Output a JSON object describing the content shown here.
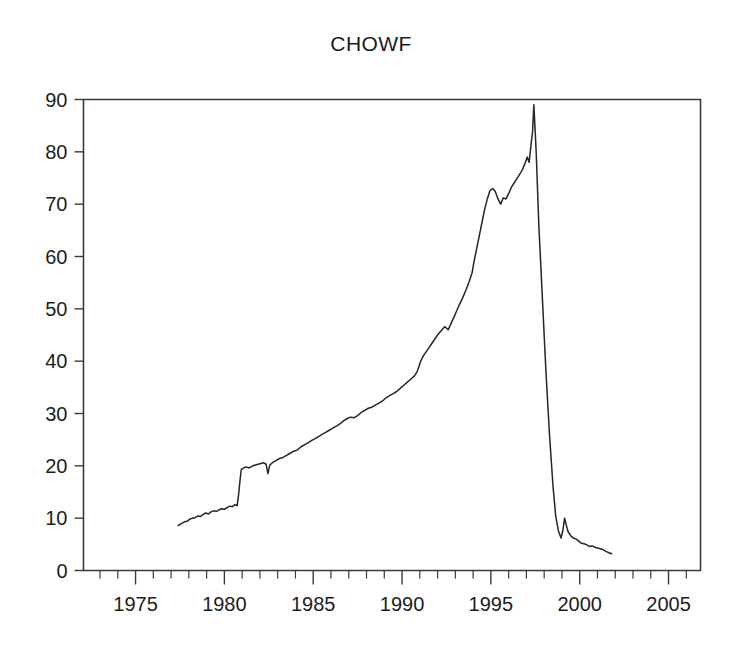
{
  "chart_data": {
    "type": "line",
    "title": "CHOWF",
    "xlabel": "",
    "ylabel": "",
    "xlim": [
      1972.07,
      2006.8
    ],
    "ylim": [
      0,
      90
    ],
    "grid": false,
    "legend": null,
    "x_ticks": [
      1975,
      1980,
      1985,
      1990,
      1995,
      2000,
      2005
    ],
    "x_tick_labels": [
      "1975",
      "1980",
      "1985",
      "1990",
      "1995",
      "2000",
      "2005"
    ],
    "x_minor_tick_step": 1,
    "y_ticks": [
      0,
      10,
      20,
      30,
      40,
      50,
      60,
      70,
      80,
      90
    ],
    "y_tick_labels": [
      "0",
      "10",
      "20",
      "30",
      "40",
      "50",
      "60",
      "70",
      "80",
      "90"
    ],
    "line_color": "#262626",
    "series": [
      {
        "name": "CHOWF",
        "x": [
          1977.4,
          1977.6,
          1977.75,
          1977.9,
          1978.05,
          1978.2,
          1978.35,
          1978.5,
          1978.65,
          1978.8,
          1978.95,
          1979.1,
          1979.25,
          1979.4,
          1979.55,
          1979.7,
          1979.85,
          1980.0,
          1980.15,
          1980.3,
          1980.45,
          1980.6,
          1980.72,
          1980.8,
          1980.88,
          1980.95,
          1981.05,
          1981.2,
          1981.4,
          1981.6,
          1981.8,
          1982.0,
          1982.2,
          1982.35,
          1982.45,
          1982.55,
          1982.7,
          1982.9,
          1983.1,
          1983.3,
          1983.5,
          1983.7,
          1983.9,
          1984.1,
          1984.3,
          1984.5,
          1984.7,
          1984.9,
          1985.1,
          1985.3,
          1985.5,
          1985.7,
          1985.9,
          1986.1,
          1986.3,
          1986.5,
          1986.7,
          1986.9,
          1987.1,
          1987.3,
          1987.5,
          1987.7,
          1987.9,
          1988.1,
          1988.3,
          1988.5,
          1988.7,
          1988.9,
          1989.1,
          1989.3,
          1989.5,
          1989.7,
          1989.9,
          1990.1,
          1990.3,
          1990.5,
          1990.7,
          1990.85,
          1990.95,
          1991.05,
          1991.2,
          1991.4,
          1991.6,
          1991.8,
          1992.0,
          1992.2,
          1992.4,
          1992.6,
          1992.8,
          1993.0,
          1993.2,
          1993.4,
          1993.6,
          1993.8,
          1993.95,
          1994.05,
          1994.2,
          1994.35,
          1994.5,
          1994.65,
          1994.8,
          1994.95,
          1995.1,
          1995.25,
          1995.4,
          1995.55,
          1995.7,
          1995.85,
          1996.0,
          1996.15,
          1996.3,
          1996.45,
          1996.6,
          1996.75,
          1996.9,
          1997.05,
          1997.15,
          1997.25,
          1997.35,
          1997.42,
          1997.55,
          1997.7,
          1997.9,
          1998.1,
          1998.3,
          1998.5,
          1998.65,
          1998.8,
          1998.95,
          1999.05,
          1999.15,
          1999.25,
          1999.35,
          1999.5,
          1999.65,
          1999.8,
          1999.95,
          2000.1,
          2000.25,
          2000.4,
          2000.55,
          2000.7,
          2000.9,
          2001.1,
          2001.3,
          2001.5,
          2001.65,
          2001.8
        ],
        "y": [
          8.6,
          9.0,
          9.3,
          9.4,
          9.8,
          10.0,
          10.1,
          10.4,
          10.3,
          10.7,
          11.0,
          10.8,
          11.2,
          11.4,
          11.3,
          11.6,
          11.8,
          11.7,
          12.0,
          12.3,
          12.2,
          12.6,
          12.4,
          14.5,
          17.2,
          19.3,
          19.5,
          19.8,
          19.6,
          20.0,
          20.2,
          20.4,
          20.6,
          20.3,
          18.5,
          20.1,
          20.6,
          21.0,
          21.4,
          21.6,
          22.0,
          22.4,
          22.8,
          23.0,
          23.6,
          24.0,
          24.4,
          24.8,
          25.2,
          25.6,
          26.0,
          26.4,
          26.8,
          27.2,
          27.6,
          28.0,
          28.6,
          29.0,
          29.3,
          29.2,
          29.6,
          30.2,
          30.6,
          31.0,
          31.2,
          31.6,
          32.0,
          32.4,
          33.0,
          33.4,
          33.8,
          34.2,
          34.8,
          35.4,
          36.0,
          36.6,
          37.2,
          38.0,
          39.0,
          40.0,
          41.0,
          42.0,
          43.0,
          44.0,
          45.0,
          45.8,
          46.6,
          46.0,
          47.5,
          49.0,
          50.6,
          52.0,
          53.6,
          55.4,
          57.0,
          59.0,
          61.5,
          64.0,
          66.5,
          69.0,
          71.0,
          72.6,
          73.0,
          72.4,
          71.0,
          70.0,
          71.2,
          71.0,
          72.0,
          73.2,
          74.0,
          74.8,
          75.6,
          76.4,
          77.6,
          79.0,
          78.0,
          81.0,
          84.0,
          89.0,
          80.0,
          66.0,
          52.0,
          38.0,
          26.0,
          16.0,
          10.4,
          7.6,
          6.2,
          7.6,
          10.0,
          8.6,
          7.4,
          6.6,
          6.2,
          6.0,
          5.6,
          5.2,
          5.1,
          4.9,
          4.6,
          4.7,
          4.4,
          4.2,
          4.0,
          3.6,
          3.4,
          3.2
        ]
      }
    ]
  }
}
